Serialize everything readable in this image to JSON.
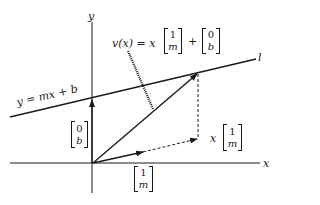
{
  "diagram": {
    "axes": {
      "x_label": "x",
      "y_label": "y"
    },
    "line": {
      "name_label": "l",
      "equation": "y = mx + b"
    },
    "vector_equation": {
      "lhs": "v(x) = x",
      "plus": "+",
      "direction_top": "1",
      "direction_bottom": "m",
      "offset_top": "0",
      "offset_bottom": "b"
    },
    "offset_vector": {
      "top": "0",
      "bottom": "b"
    },
    "direction_vector": {
      "top": "1",
      "bottom": "m"
    },
    "scaled_direction_vector": {
      "scalar": "x",
      "top": "1",
      "bottom": "m"
    },
    "colors": {
      "ink": "#1a1a1a",
      "background": "#ffffff"
    }
  }
}
